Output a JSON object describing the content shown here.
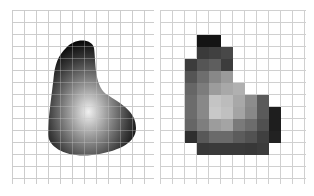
{
  "figure": {
    "left_panel": {
      "label": "continuous image",
      "grid_spacing_px": 12
    },
    "right_panel": {
      "label": "sampled and quantized image",
      "grid_spacing_px": 12,
      "cells": [
        [
          2,
          3,
          "#141414"
        ],
        [
          2,
          4,
          "#141414"
        ],
        [
          3,
          3,
          "#3a3a3a"
        ],
        [
          3,
          4,
          "#404040"
        ],
        [
          3,
          5,
          "#484848"
        ],
        [
          4,
          2,
          "#3c3c3c"
        ],
        [
          4,
          3,
          "#555555"
        ],
        [
          4,
          4,
          "#5e5e5e"
        ],
        [
          4,
          5,
          "#3c3c3c"
        ],
        [
          5,
          2,
          "#555555"
        ],
        [
          5,
          3,
          "#6e6e6e"
        ],
        [
          5,
          4,
          "#888888"
        ],
        [
          5,
          5,
          "#9a9a9a"
        ],
        [
          6,
          2,
          "#666666"
        ],
        [
          6,
          3,
          "#7c7c7c"
        ],
        [
          6,
          4,
          "#9c9c9c"
        ],
        [
          6,
          5,
          "#a8a8a8"
        ],
        [
          6,
          6,
          "#b0b0b0"
        ],
        [
          7,
          2,
          "#6c6c6c"
        ],
        [
          7,
          3,
          "#888888"
        ],
        [
          7,
          4,
          "#c4c4c4"
        ],
        [
          7,
          5,
          "#bcbcbc"
        ],
        [
          7,
          6,
          "#a8a8a8"
        ],
        [
          7,
          7,
          "#8c8c8c"
        ],
        [
          7,
          8,
          "#5a5a5a"
        ],
        [
          8,
          2,
          "#6c6c6c"
        ],
        [
          8,
          3,
          "#888888"
        ],
        [
          8,
          4,
          "#c8c8c8"
        ],
        [
          8,
          5,
          "#c0c0c0"
        ],
        [
          8,
          6,
          "#a4a4a4"
        ],
        [
          8,
          7,
          "#888888"
        ],
        [
          8,
          8,
          "#5a5a5a"
        ],
        [
          8,
          9,
          "#1e1e1e"
        ],
        [
          9,
          2,
          "#666666"
        ],
        [
          9,
          3,
          "#7e7e7e"
        ],
        [
          9,
          4,
          "#9c9c9c"
        ],
        [
          9,
          5,
          "#a4a4a4"
        ],
        [
          9,
          6,
          "#7a7a7a"
        ],
        [
          9,
          7,
          "#6c6c6c"
        ],
        [
          9,
          8,
          "#505050"
        ],
        [
          9,
          9,
          "#1e1e1e"
        ],
        [
          10,
          2,
          "#2e2e2e"
        ],
        [
          10,
          3,
          "#585858"
        ],
        [
          10,
          4,
          "#6a6a6a"
        ],
        [
          10,
          5,
          "#6a6a6a"
        ],
        [
          10,
          6,
          "#5c5c5c"
        ],
        [
          10,
          7,
          "#525252"
        ],
        [
          10,
          8,
          "#404040"
        ],
        [
          10,
          9,
          "#222222"
        ],
        [
          11,
          3,
          "#383838"
        ],
        [
          11,
          4,
          "#3a3a3a"
        ],
        [
          11,
          5,
          "#3a3a3a"
        ],
        [
          11,
          6,
          "#3a3a3a"
        ],
        [
          11,
          7,
          "#383838"
        ],
        [
          11,
          8,
          "#3c3c3c"
        ]
      ]
    }
  }
}
